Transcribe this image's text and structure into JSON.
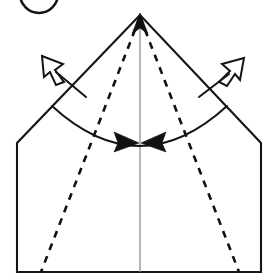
{
  "diagram": {
    "title": "Origami fold step diagram",
    "type": "origami-instruction",
    "canvas": {
      "width": 272,
      "height": 278,
      "background": "#ffffff"
    },
    "colors": {
      "edge": "#151515",
      "crease": "#111111",
      "center_line": "#8e8e92",
      "arrow_fill": "#111111",
      "arrow_open_fill": "#ffffff",
      "background": "#ffffff"
    },
    "step_badge": {
      "name": "step-number-circle",
      "label": "",
      "note": "circle partially cropped by top edge of image",
      "center_x": 39,
      "center_y": -6,
      "radius": 19
    },
    "shape": {
      "name": "pentagon-house-outline",
      "apex": {
        "x": 140,
        "y": 15
      },
      "left_shoulder": {
        "x": 17,
        "y": 143
      },
      "right_shoulder": {
        "x": 261,
        "y": 143
      },
      "left_bottom": {
        "x": 17,
        "y": 272
      },
      "right_bottom": {
        "x": 261,
        "y": 272
      }
    },
    "center_line": {
      "name": "vertical-center-crease",
      "from": {
        "x": 140,
        "y": 15
      },
      "to": {
        "x": 140,
        "y": 272
      }
    },
    "creases": [
      {
        "name": "left-valley-crease",
        "style": "dashed",
        "from": {
          "x": 140,
          "y": 17
        },
        "to": {
          "x": 41,
          "y": 272
        }
      },
      {
        "name": "right-valley-crease",
        "style": "dashed",
        "from": {
          "x": 140,
          "y": 17
        },
        "to": {
          "x": 239,
          "y": 272
        }
      }
    ],
    "motion_arc": {
      "name": "fold-motion-arc",
      "from": {
        "x": 52,
        "y": 106
      },
      "to": {
        "x": 227,
        "y": 106
      },
      "sag_y": 146,
      "arrowheads": 2,
      "arrowhead_direction": "inward-toward-center"
    },
    "arrows": [
      {
        "name": "left-open-arrow",
        "style": "open-outline",
        "direction": "up-left",
        "tip": {
          "x": 43,
          "y": 57
        },
        "tail": {
          "x": 85,
          "y": 96
        }
      },
      {
        "name": "right-open-arrow",
        "style": "open-outline",
        "direction": "up-right",
        "tip": {
          "x": 243,
          "y": 59
        },
        "tail": {
          "x": 200,
          "y": 96
        }
      },
      {
        "name": "apex-up-arrow",
        "style": "solid-filled",
        "direction": "up",
        "tip": {
          "x": 140,
          "y": 15
        }
      }
    ]
  }
}
